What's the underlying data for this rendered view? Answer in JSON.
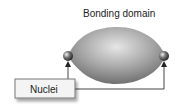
{
  "diagram": {
    "title": "Bonding domain",
    "box_label": "Nuclei",
    "colors": {
      "domain_fill": "#9a9a9a",
      "nucleus_fill": "#555555",
      "line": "#444444",
      "box_fill": "#f4f4f4",
      "box_border": "#777777"
    }
  }
}
